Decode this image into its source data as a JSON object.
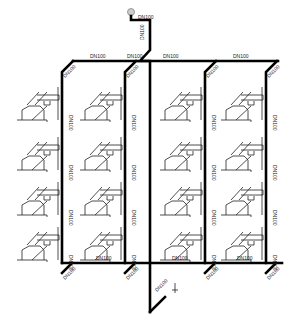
{
  "diagram": {
    "type": "drainage/water riser isometric system diagram",
    "pipe_size_label": "DN100",
    "colors": {
      "pipe": "#000000",
      "fixture": "#222222",
      "background": "#ffffff"
    },
    "labels": {
      "top_vent": "DN100",
      "top_riser": "DN100",
      "top_main_1": "DN100",
      "top_main_2": "DN100",
      "top_main_3": "DN100",
      "top_main_4": "DN100",
      "bottom_main_1": "DN100",
      "bottom_main_2": "DN100",
      "bottom_main_3": "DN100",
      "outlet": "DN100"
    },
    "stacks": [
      {
        "name": "stack-1",
        "floors": 4,
        "label": "DN100"
      },
      {
        "name": "stack-2",
        "floors": 4,
        "label": "DN100"
      },
      {
        "name": "stack-3",
        "floors": 4,
        "label": "DN100"
      },
      {
        "name": "stack-4",
        "floors": 4,
        "label": "DN100"
      }
    ]
  }
}
